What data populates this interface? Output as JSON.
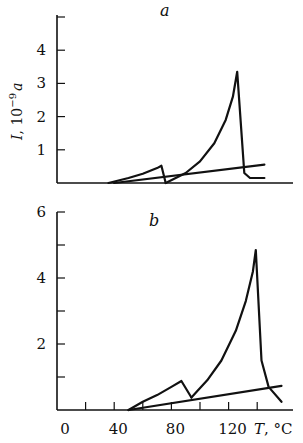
{
  "chart_data": [
    {
      "type": "line",
      "panel_label": "a",
      "ylabel": "I, 10⁻⁹ a",
      "xlabel": "",
      "ylim": [
        0,
        5
      ],
      "yticks": [
        1,
        2,
        3,
        4
      ],
      "ytick_labels": [
        "1",
        "2",
        "3",
        "4"
      ],
      "xlim": [
        0,
        165
      ],
      "grid": false,
      "series": [
        {
          "name": "first peak",
          "x": [
            36,
            50,
            60,
            70,
            73,
            76
          ],
          "y": [
            0,
            0.15,
            0.28,
            0.45,
            0.52,
            0.0
          ]
        },
        {
          "name": "baseline line",
          "x": [
            40,
            145
          ],
          "y": [
            0,
            0.55
          ]
        },
        {
          "name": "main peak",
          "x": [
            76,
            90,
            100,
            110,
            118,
            123,
            126,
            131,
            135,
            145
          ],
          "y": [
            0,
            0.3,
            0.65,
            1.2,
            1.9,
            2.6,
            3.35,
            0.3,
            0.15,
            0.15
          ]
        }
      ]
    },
    {
      "type": "line",
      "panel_label": "b",
      "ylabel": "",
      "xlabel": "T, °C",
      "ylim": [
        0,
        6
      ],
      "yticks": [
        1,
        2,
        3,
        4,
        5,
        6
      ],
      "ytick_labels": [
        "2",
        "4",
        "6"
      ],
      "ytick_label_values": [
        2,
        4,
        6
      ],
      "xticks": [
        0,
        20,
        40,
        60,
        80,
        100,
        120,
        140
      ],
      "xtick_labels": [
        "0",
        "40",
        "80",
        "120"
      ],
      "xtick_label_values": [
        0,
        40,
        80,
        120
      ],
      "xlim": [
        0,
        165
      ],
      "grid": false,
      "series": [
        {
          "name": "first peak",
          "x": [
            50,
            60,
            70,
            80,
            87,
            94
          ],
          "y": [
            0,
            0.25,
            0.45,
            0.7,
            0.88,
            0.38
          ]
        },
        {
          "name": "baseline line",
          "x": [
            50,
            157
          ],
          "y": [
            0,
            0.73
          ]
        },
        {
          "name": "main peak",
          "x": [
            94,
            105,
            115,
            125,
            132,
            137,
            139,
            143,
            148,
            157
          ],
          "y": [
            0.38,
            0.9,
            1.5,
            2.4,
            3.3,
            4.2,
            4.85,
            1.5,
            0.7,
            0.25
          ]
        }
      ]
    }
  ],
  "labels": {
    "panel_a": "a",
    "panel_b": "b",
    "ylabel": "I, 10",
    "ylabel_exp": "−9",
    "ylabel_unit": "a",
    "xlabel": "T, °C"
  },
  "style": {
    "line_color": "#111111",
    "background": "#ffffff"
  }
}
